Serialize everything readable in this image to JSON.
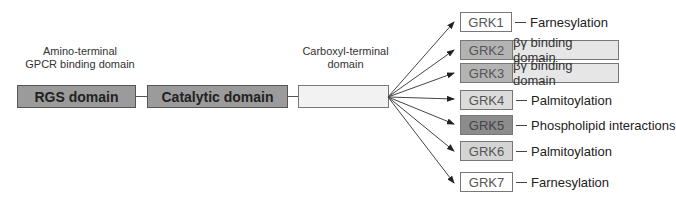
{
  "labels": {
    "amino_line1": "Amino-terminal",
    "amino_line2": "GPCR binding domain",
    "carboxyl_line1": "Carboxyl-terminal",
    "carboxyl_line2": "domain"
  },
  "domains": [
    {
      "name": "RGS domain",
      "color": "#9b9b9b"
    },
    {
      "name": "Catalytic domain",
      "color": "#9b9b9b"
    },
    {
      "name": "",
      "color": "#f2f2f2"
    }
  ],
  "grks": [
    {
      "label": "GRK1",
      "feature": "Farnesylation",
      "color": "#ffffff",
      "style": "tag"
    },
    {
      "label": "GRK2",
      "feature": "βγ binding domain",
      "color": "#b3b3b3",
      "ext_color": "#e6e6e6",
      "style": "extended"
    },
    {
      "label": "GRK3",
      "feature": "βγ binding domain",
      "color": "#b3b3b3",
      "ext_color": "#e6e6e6",
      "style": "extended"
    },
    {
      "label": "GRK4",
      "feature": "Palmitoylation",
      "color": "#dcdcdc",
      "style": "tag"
    },
    {
      "label": "GRK5",
      "feature": "Phospholipid interactions",
      "color": "#8c8c8c",
      "style": "tag"
    },
    {
      "label": "GRK6",
      "feature": "Palmitoylation",
      "color": "#d4d4d4",
      "style": "tag"
    },
    {
      "label": "GRK7",
      "feature": "Farnesylation",
      "color": "#ffffff",
      "style": "tag"
    }
  ],
  "colors": {
    "line": "#444444",
    "border": "#555555"
  }
}
